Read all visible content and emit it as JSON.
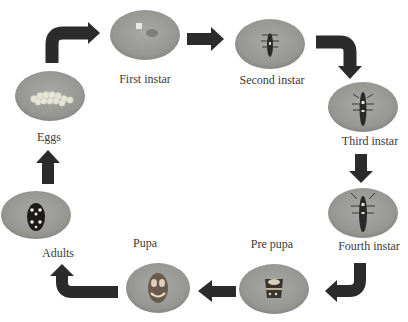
{
  "diagram": {
    "type": "life-cycle",
    "colors": {
      "arrow": "#2b2b2b",
      "ellipse_fill": "#9a9a96",
      "ellipse_edge": "#7e7e7a",
      "label": "#3a3a3a",
      "background": "#ffffff"
    },
    "stages": [
      {
        "id": "eggs",
        "label": "Eggs",
        "icon": "egg-cluster-icon"
      },
      {
        "id": "first-instar",
        "label": "First instar",
        "icon": "first-instar-larva-icon"
      },
      {
        "id": "second-instar",
        "label": "Second instar",
        "icon": "larva-icon"
      },
      {
        "id": "third-instar",
        "label": "Third instar",
        "icon": "larva-icon"
      },
      {
        "id": "fourth-instar",
        "label": "Fourth instar",
        "icon": "larva-icon"
      },
      {
        "id": "pre-pupa",
        "label": "Pre pupa",
        "icon": "pre-pupa-icon"
      },
      {
        "id": "pupa",
        "label": "Pupa",
        "icon": "pupa-icon"
      },
      {
        "id": "adults",
        "label": "Adults",
        "icon": "ladybird-beetle-icon"
      }
    ],
    "flow": [
      [
        "eggs",
        "first-instar"
      ],
      [
        "first-instar",
        "second-instar"
      ],
      [
        "second-instar",
        "third-instar"
      ],
      [
        "third-instar",
        "fourth-instar"
      ],
      [
        "fourth-instar",
        "pre-pupa"
      ],
      [
        "pre-pupa",
        "pupa"
      ],
      [
        "pupa",
        "adults"
      ],
      [
        "adults",
        "eggs"
      ]
    ]
  }
}
